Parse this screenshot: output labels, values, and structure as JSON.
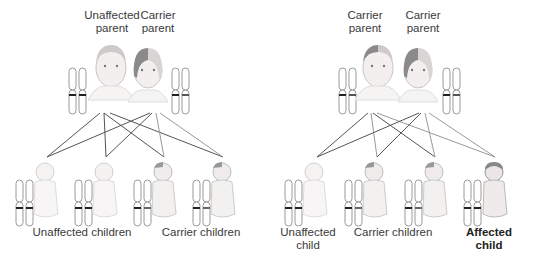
{
  "left_panel": {
    "parents": [
      {
        "label_line1": "Unaffected",
        "label_line2": "parent",
        "status": "unaffected"
      },
      {
        "label_line1": "Carrier",
        "label_line2": "parent",
        "status": "carrier"
      }
    ],
    "children_groups": [
      {
        "label": "Unaffected children",
        "count": 2
      },
      {
        "label": "Carrier children",
        "count": 2
      }
    ]
  },
  "right_panel": {
    "parents": [
      {
        "label_line1": "Carrier",
        "label_line2": "parent",
        "status": "carrier"
      },
      {
        "label_line1": "Carrier",
        "label_line2": "parent",
        "status": "carrier"
      }
    ],
    "children_groups": [
      {
        "label_line1": "Unaffected",
        "label_line2": "child",
        "count": 1
      },
      {
        "label": "Carrier children",
        "count": 2
      },
      {
        "label_line1": "Affected",
        "label_line2": "child",
        "count": 1,
        "emphasis": "bold"
      }
    ]
  },
  "colors": {
    "line_dark": "#555555",
    "line_light": "#999999",
    "chromosome_outline": "#9a9a9a",
    "band": "#222222",
    "skin": "#f2eeee",
    "shade": "#8a8a8a"
  }
}
